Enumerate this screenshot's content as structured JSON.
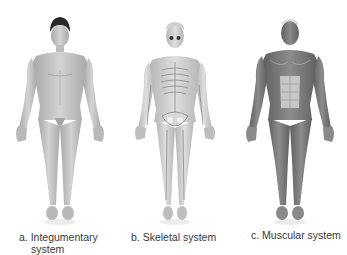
{
  "figures": [
    {
      "id": "a",
      "label": "a. Integumentary",
      "label_line2": "system",
      "type": "integumentary"
    },
    {
      "id": "b",
      "label": "b. Skeletal system",
      "type": "skeletal"
    },
    {
      "id": "c",
      "label": "c. Muscular system",
      "type": "muscular"
    }
  ],
  "colors": {
    "skin": "#c8c8c8",
    "skin_shade": "#a9a9a9",
    "hair": "#2a2a2a",
    "bone": "#eeeeee",
    "muscle": "#7d7d7d",
    "muscle_light": "#bdbdbd",
    "text": "#3a3a3a"
  }
}
